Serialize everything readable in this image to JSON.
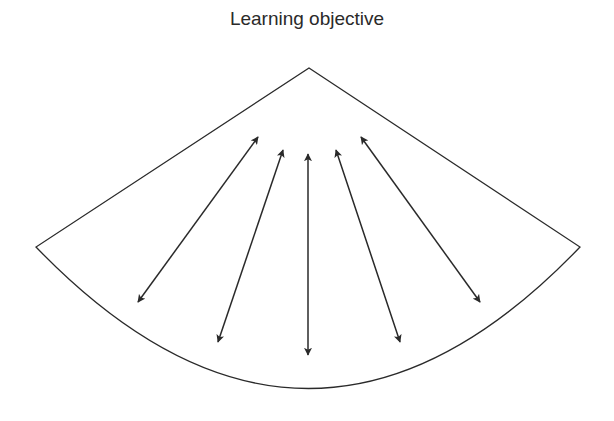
{
  "title": "Learning objective",
  "diagram": {
    "shape": "circular-sector",
    "apex": [
      309,
      68
    ],
    "left_corner": [
      36,
      247
    ],
    "right_corner": [
      580,
      247
    ],
    "arc_bottom_y": 387,
    "stroke_color": "#2a2a2a",
    "arrows": [
      {
        "from": [
          258,
          137
        ],
        "to": [
          138,
          302
        ],
        "type": "double-headed"
      },
      {
        "from": [
          283,
          150
        ],
        "to": [
          218,
          342
        ],
        "type": "double-headed"
      },
      {
        "from": [
          308,
          154
        ],
        "to": [
          308,
          355
        ],
        "type": "double-headed"
      },
      {
        "from": [
          336,
          150
        ],
        "to": [
          400,
          342
        ],
        "type": "double-headed"
      },
      {
        "from": [
          361,
          137
        ],
        "to": [
          480,
          302
        ],
        "type": "double-headed"
      }
    ]
  }
}
